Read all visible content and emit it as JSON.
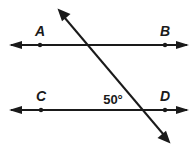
{
  "figure": {
    "kind": "geometry-diagram",
    "width": 194,
    "height": 152,
    "background_color": "#ffffff",
    "stroke_color": "#1a1a1a",
    "line_width": 2,
    "point_radius": 2.2
  },
  "lines": {
    "top": {
      "name": "line-AB",
      "y": 45,
      "x_start": 11,
      "x_end": 187,
      "double_arrow": true
    },
    "bottom": {
      "name": "line-CD",
      "y": 110,
      "x_start": 11,
      "x_end": 187,
      "double_arrow": true
    },
    "transversal": {
      "name": "transversal-line",
      "x_start": 59,
      "y_start": 11,
      "x_end": 169,
      "y_end": 141,
      "double_arrow": true
    }
  },
  "points": [
    {
      "id": "A",
      "label": "A",
      "dot_x": 40,
      "dot_y": 45,
      "label_x": 40,
      "label_y": 31
    },
    {
      "id": "B",
      "label": "B",
      "dot_x": 165,
      "dot_y": 45,
      "label_x": 165,
      "label_y": 31
    },
    {
      "id": "C",
      "label": "C",
      "dot_x": 41,
      "dot_y": 110,
      "label_x": 41,
      "label_y": 96
    },
    {
      "id": "D",
      "label": "D",
      "dot_x": 165,
      "dot_y": 110,
      "label_x": 165,
      "label_y": 96
    }
  ],
  "angles": [
    {
      "id": "angle-50",
      "label": "50°",
      "value": 50,
      "unit": "degrees",
      "label_x": 113,
      "label_y": 99
    }
  ],
  "intersections": [
    {
      "id": "top-intersection",
      "x": 90,
      "y": 45
    },
    {
      "id": "bottom-intersection",
      "x": 143,
      "y": 110
    }
  ]
}
